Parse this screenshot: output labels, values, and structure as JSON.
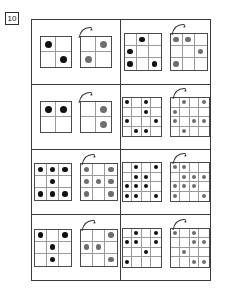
{
  "page": {
    "number_label": "10",
    "dot_colors": {
      "source": "#111111",
      "answer": "#6e6e6e"
    },
    "frame_color": "#3a3a3a",
    "background": "#ffffff"
  },
  "legend": {
    "arrow_name": "rotation-arrow",
    "arrow_meaning": "rotate 90 degrees clockwise"
  },
  "puzzles": [
    {
      "id": 1,
      "size": 2,
      "source": [
        [
          1,
          0
        ],
        [
          0,
          1
        ]
      ],
      "answer": [
        [
          0,
          1
        ],
        [
          1,
          0
        ]
      ]
    },
    {
      "id": 2,
      "size": 3,
      "source": [
        [
          0,
          1,
          0
        ],
        [
          1,
          0,
          0
        ],
        [
          1,
          0,
          1
        ]
      ],
      "answer": [
        [
          1,
          1,
          0
        ],
        [
          0,
          0,
          1
        ],
        [
          1,
          0,
          0
        ]
      ]
    },
    {
      "id": 3,
      "size": 2,
      "source": [
        [
          1,
          1
        ],
        [
          0,
          0
        ]
      ],
      "answer": [
        [
          0,
          1
        ],
        [
          0,
          1
        ]
      ]
    },
    {
      "id": 4,
      "size": 4,
      "source": [
        [
          1,
          0,
          1,
          0
        ],
        [
          0,
          0,
          1,
          0
        ],
        [
          1,
          0,
          0,
          1
        ],
        [
          0,
          1,
          1,
          0
        ]
      ],
      "answer": [
        [
          0,
          1,
          0,
          1
        ],
        [
          1,
          0,
          0,
          0
        ],
        [
          1,
          0,
          1,
          1
        ],
        [
          0,
          1,
          0,
          0
        ]
      ]
    },
    {
      "id": 5,
      "size": 3,
      "source": [
        [
          1,
          1,
          1
        ],
        [
          0,
          1,
          0
        ],
        [
          1,
          1,
          1
        ]
      ],
      "answer": [
        [
          1,
          0,
          1
        ],
        [
          1,
          1,
          1
        ],
        [
          1,
          0,
          1
        ]
      ]
    },
    {
      "id": 6,
      "size": 4,
      "source": [
        [
          0,
          1,
          0,
          1
        ],
        [
          0,
          1,
          1,
          0
        ],
        [
          1,
          1,
          1,
          0
        ],
        [
          1,
          1,
          0,
          1
        ]
      ],
      "answer": [
        [
          1,
          1,
          0,
          0
        ],
        [
          0,
          1,
          1,
          1
        ],
        [
          1,
          1,
          1,
          0
        ],
        [
          1,
          0,
          0,
          1
        ]
      ]
    },
    {
      "id": 7,
      "size": 3,
      "source": [
        [
          1,
          0,
          1
        ],
        [
          0,
          1,
          0
        ],
        [
          0,
          1,
          0
        ]
      ],
      "answer": [
        [
          0,
          0,
          1
        ],
        [
          1,
          1,
          0
        ],
        [
          0,
          0,
          1
        ]
      ]
    },
    {
      "id": 8,
      "size": 4,
      "source": [
        [
          0,
          1,
          0,
          1
        ],
        [
          1,
          1,
          0,
          1
        ],
        [
          0,
          0,
          1,
          0
        ],
        [
          1,
          0,
          0,
          0
        ]
      ],
      "answer": [
        [
          1,
          0,
          1,
          0
        ],
        [
          0,
          0,
          1,
          1
        ],
        [
          0,
          1,
          0,
          0
        ],
        [
          0,
          0,
          1,
          1
        ]
      ]
    }
  ]
}
